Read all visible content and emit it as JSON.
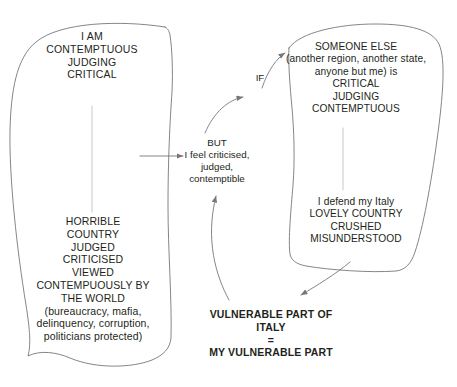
{
  "diagram": {
    "title": "Vulnerable Part of Italy = My Vulnerable Part",
    "background_color": "#ffffff",
    "stroke_color": "#6f7072",
    "text_color": "#231f20",
    "nodes": {
      "self_critical": "I AM\nCONTEMPTUOUS\nJUDGING\nCRITICAL",
      "horrible_country": "HORRIBLE\nCOUNTRY\nJUDGED\nCRITICISED\nVIEWED\nCONTEMPUOUSLY BY\nTHE WORLD\n(bureaucracy, mafia,\ndelinquency, corruption,\npoliticians protected)",
      "but_block": "BUT\nI feel criticised,\njudged,\ncontemptible",
      "if_label": "IF",
      "someone_else": "SOMEONE ELSE\n(another region, another state,\nanyone but me) is\nCRITICAL\nJUDGING\nCONTEMPTUOUS",
      "defend_italy": "I defend my Italy\nLOVELY COUNTRY\nCRUSHED\nMISUNDERSTOOD",
      "conclusion": "VULNERABLE PART OF\nITALY\n=\nMY VULNERABLE PART"
    }
  }
}
